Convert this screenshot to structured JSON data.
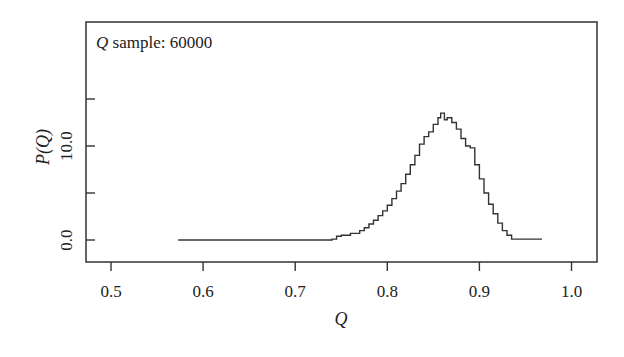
{
  "chart_data": {
    "type": "line",
    "title": "",
    "annotation": {
      "italic": "Q",
      "text": " sample: 60000"
    },
    "xlabel": "Q",
    "ylabel": "P(Q)",
    "xlim": [
      0.48,
      1.03
    ],
    "ylim": [
      -2.3,
      23.3
    ],
    "x_ticks": [
      0.5,
      0.6,
      0.7,
      0.8,
      0.9,
      1.0
    ],
    "x_tick_labels": [
      "0.5",
      "0.6",
      "0.7",
      "0.8",
      "0.9",
      "1.0"
    ],
    "y_ticks": [
      0,
      5,
      10,
      15
    ],
    "y_tick_labels": [
      "0.0",
      "",
      "10.0",
      ""
    ],
    "grid": false,
    "legend": null,
    "series": [
      {
        "name": "P(Q) histogram (step)",
        "x": [
          0.573,
          0.6,
          0.65,
          0.7,
          0.74,
          0.745,
          0.75,
          0.76,
          0.77,
          0.775,
          0.78,
          0.785,
          0.79,
          0.795,
          0.8,
          0.805,
          0.81,
          0.815,
          0.82,
          0.825,
          0.83,
          0.835,
          0.84,
          0.845,
          0.85,
          0.855,
          0.858,
          0.862,
          0.865,
          0.87,
          0.875,
          0.88,
          0.885,
          0.89,
          0.895,
          0.9,
          0.905,
          0.91,
          0.915,
          0.92,
          0.925,
          0.93,
          0.935,
          0.95,
          0.968
        ],
        "y": [
          0.0,
          0.0,
          0.0,
          0.0,
          0.1,
          0.4,
          0.5,
          0.7,
          1.0,
          1.3,
          1.7,
          2.1,
          2.6,
          3.1,
          3.7,
          4.4,
          5.2,
          6.0,
          7.0,
          8.0,
          9.0,
          10.2,
          11.0,
          11.5,
          12.3,
          13.0,
          13.5,
          12.8,
          13.0,
          12.5,
          11.8,
          10.8,
          10.0,
          9.8,
          8.0,
          6.5,
          5.0,
          3.8,
          2.8,
          1.8,
          1.0,
          0.5,
          0.1,
          0.1,
          0.1
        ]
      }
    ]
  }
}
